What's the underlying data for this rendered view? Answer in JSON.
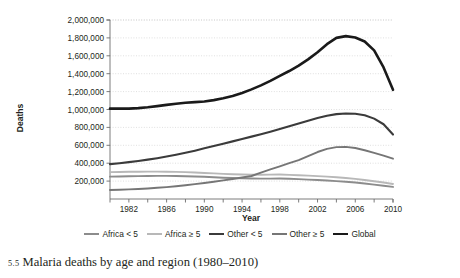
{
  "caption": {
    "number": "5.5",
    "text": "Malaria deaths by age and region (1980–2010)"
  },
  "chart_data": {
    "type": "line",
    "title": "",
    "xlabel": "Year",
    "ylabel": "Deaths",
    "xlim": [
      1980,
      2010
    ],
    "ylim": [
      0,
      2000000
    ],
    "grid": true,
    "legend_position": "bottom",
    "x": [
      1980,
      1981,
      1982,
      1983,
      1984,
      1985,
      1986,
      1987,
      1988,
      1989,
      1990,
      1991,
      1992,
      1993,
      1994,
      1995,
      1996,
      1997,
      1998,
      1999,
      2000,
      2001,
      2002,
      2003,
      2004,
      2005,
      2006,
      2007,
      2008,
      2009,
      2010
    ],
    "xtick_values": [
      1980,
      1982,
      1984,
      1986,
      1988,
      1990,
      1992,
      1994,
      1996,
      1998,
      2000,
      2002,
      2004,
      2006,
      2008,
      2010
    ],
    "xtick_labels": [
      "1982",
      "1986",
      "1990",
      "1994",
      "1998",
      "2002",
      "2006",
      "2010"
    ],
    "xtick_labeled_values": [
      1982,
      1986,
      1990,
      1994,
      1998,
      2002,
      2006,
      2010
    ],
    "ytick_values": [
      200000,
      400000,
      600000,
      800000,
      1000000,
      1200000,
      1400000,
      1600000,
      1800000,
      2000000
    ],
    "ytick_labels": [
      "200,000",
      "400,000",
      "600,000",
      "800,000",
      "1,000,000",
      "1,200,000",
      "1,400,000",
      "1,600,000",
      "1,800,000",
      "2,000,000"
    ],
    "series": [
      {
        "name": "Africa < 5",
        "color": "#8c8c8c",
        "width": 1.9,
        "values": [
          250000,
          252000,
          254000,
          256000,
          257000,
          258000,
          258000,
          257000,
          255000,
          252000,
          248000,
          243000,
          238000,
          234000,
          231000,
          229000,
          228000,
          228000,
          229000,
          226000,
          222000,
          217000,
          212000,
          206000,
          200000,
          193000,
          184000,
          173000,
          161000,
          148000,
          135000
        ]
      },
      {
        "name": "Africa ≥ 5",
        "color": "#b8b8b8",
        "width": 1.9,
        "values": [
          300000,
          302000,
          304000,
          305000,
          306000,
          306000,
          305000,
          303000,
          300000,
          296000,
          291000,
          286000,
          281000,
          277000,
          274000,
          272000,
          271000,
          272000,
          273000,
          270000,
          266000,
          261000,
          256000,
          250000,
          243000,
          235000,
          225000,
          213000,
          199000,
          184000,
          168000
        ]
      },
      {
        "name": "Other < 5",
        "color": "#3b3b3b",
        "width": 2.1,
        "values": [
          390000,
          400000,
          412000,
          425000,
          440000,
          456000,
          474000,
          494000,
          516000,
          540000,
          566000,
          592000,
          618000,
          644000,
          670000,
          697000,
          724000,
          752000,
          782000,
          812000,
          843000,
          875000,
          905000,
          930000,
          948000,
          956000,
          952000,
          935000,
          898000,
          835000,
          720000
        ]
      },
      {
        "name": "Other ≥ 5",
        "color": "#767676",
        "width": 1.9,
        "values": [
          100000,
          103000,
          107000,
          112000,
          118000,
          125000,
          133000,
          143000,
          154000,
          166000,
          179000,
          193000,
          208000,
          224000,
          240000,
          257000,
          295000,
          330000,
          365000,
          400000,
          435000,
          480000,
          525000,
          560000,
          580000,
          582000,
          570000,
          545000,
          515000,
          485000,
          450000
        ]
      },
      {
        "name": "Global",
        "color": "#1a1a1a",
        "width": 2.6,
        "values": [
          1010000,
          1012000,
          1010000,
          1015000,
          1025000,
          1038000,
          1052000,
          1065000,
          1075000,
          1082000,
          1090000,
          1105000,
          1125000,
          1150000,
          1185000,
          1225000,
          1270000,
          1320000,
          1375000,
          1430000,
          1490000,
          1560000,
          1640000,
          1730000,
          1800000,
          1820000,
          1805000,
          1760000,
          1660000,
          1470000,
          1220000
        ]
      }
    ]
  },
  "legend": {
    "items": [
      {
        "label": "Africa < 5",
        "color": "#8c8c8c",
        "width": 2
      },
      {
        "label": "Africa ≥ 5",
        "color": "#b8b8b8",
        "width": 2
      },
      {
        "label": "Other < 5",
        "color": "#3b3b3b",
        "width": 2.4
      },
      {
        "label": "Other ≥ 5",
        "color": "#767676",
        "width": 2
      },
      {
        "label": "Global",
        "color": "#1a1a1a",
        "width": 2.8
      }
    ]
  }
}
